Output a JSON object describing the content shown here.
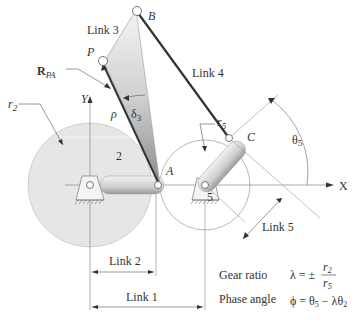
{
  "labels": {
    "link3": "Link 3",
    "link4": "Link 4",
    "link5": "Link 5",
    "link2": "Link 2",
    "link1": "Link 1",
    "point_b": "B",
    "point_p": "P",
    "point_a": "A",
    "point_c": "C",
    "r_pa_main": "R",
    "r_pa_sub": "PA",
    "rho": "ρ",
    "delta3_main": "δ",
    "delta3_sub": "3",
    "r2_main": "r",
    "r2_sub": "2",
    "r5_main": "r",
    "r5_sub": "5",
    "theta5_main": "θ",
    "theta5_sub": "5",
    "axis_y": "Y",
    "axis_x": "X",
    "gear2": "2",
    "gear5": "5"
  },
  "equations": {
    "gear_ratio_label": "Gear ratio",
    "gear_ratio_lhs": "λ = ±",
    "gear_ratio_num": "r",
    "gear_ratio_num_sub": "2",
    "gear_ratio_den": "r",
    "gear_ratio_den_sub": "5",
    "phase_angle_label": "Phase angle",
    "phase_angle_eq": "ϕ = θ",
    "phase_angle_sub1": "5",
    "phase_angle_mid": " − λθ",
    "phase_angle_sub2": "2"
  },
  "colors": {
    "gear_fill": "#e6e6e6",
    "link_dark": "#333333",
    "line_gray": "#888888"
  }
}
